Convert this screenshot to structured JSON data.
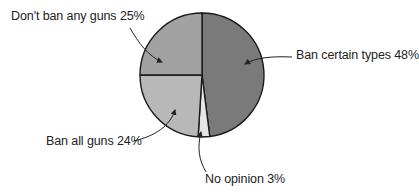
{
  "chart_data": {
    "type": "pie",
    "title": "",
    "categories": [
      "Ban certain types",
      "No opinion",
      "Ban all guns",
      "Don't ban any guns"
    ],
    "values": [
      48,
      3,
      24,
      25
    ],
    "unit": "%",
    "colors": [
      "#7a7a7a",
      "#e6e6e6",
      "#b8b8b8",
      "#a2a2a2"
    ],
    "labels": [
      "Ban certain types 48%",
      "No opinion 3%",
      "Ban all guns 24%",
      "Don't ban any guns 25%"
    ],
    "legend": "none (callout labels with arrows)",
    "start_angle": "12 o'clock, clockwise"
  }
}
